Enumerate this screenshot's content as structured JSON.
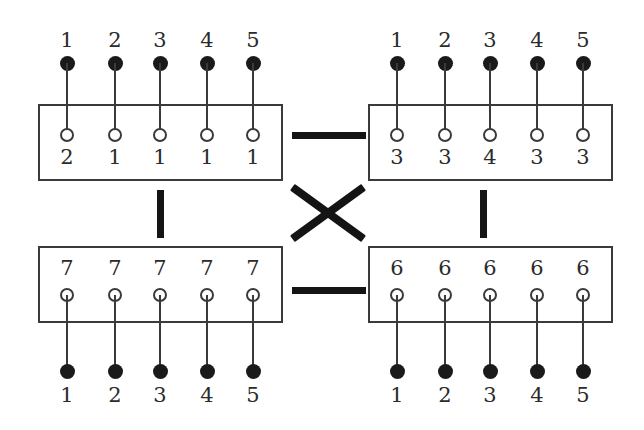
{
  "figure": {
    "colors": {
      "ink": "#2b2b2b",
      "box_stroke": "#3a3a3a",
      "connector": "#141414",
      "node_fill": "#1a1a1a",
      "background": "#ffffff"
    }
  },
  "boxes": [
    {
      "id": "top-left",
      "outer_labels": [
        "1",
        "2",
        "3",
        "4",
        "5"
      ],
      "inner_labels": [
        "2",
        "1",
        "1",
        "1",
        "1"
      ],
      "outer_position": "above",
      "inner_position": "below-circle",
      "node_count": 5
    },
    {
      "id": "top-right",
      "outer_labels": [
        "1",
        "2",
        "3",
        "4",
        "5"
      ],
      "inner_labels": [
        "3",
        "3",
        "4",
        "3",
        "3"
      ],
      "outer_position": "above",
      "inner_position": "below-circle",
      "node_count": 5
    },
    {
      "id": "bottom-left",
      "outer_labels": [
        "1",
        "2",
        "3",
        "4",
        "5"
      ],
      "inner_labels": [
        "7",
        "7",
        "7",
        "7",
        "7"
      ],
      "outer_position": "below",
      "inner_position": "above-circle",
      "node_count": 5
    },
    {
      "id": "bottom-right",
      "outer_labels": [
        "1",
        "2",
        "3",
        "4",
        "5"
      ],
      "inner_labels": [
        "6",
        "6",
        "6",
        "6",
        "6"
      ],
      "outer_position": "below",
      "inner_position": "above-circle",
      "node_count": 5
    }
  ],
  "connectors": [
    {
      "id": "top-horizontal-bar",
      "kind": "horizontal-bar",
      "between": [
        "top-left",
        "top-right"
      ]
    },
    {
      "id": "bottom-horizontal-bar",
      "kind": "horizontal-bar",
      "between": [
        "bottom-left",
        "bottom-right"
      ]
    },
    {
      "id": "left-vertical-bar",
      "kind": "vertical-bar",
      "between": [
        "top-left",
        "bottom-left"
      ]
    },
    {
      "id": "right-vertical-bar",
      "kind": "vertical-bar",
      "between": [
        "top-right",
        "bottom-right"
      ]
    },
    {
      "id": "center-cross",
      "kind": "x-cross",
      "between": [
        "top-left",
        "bottom-right",
        "top-right",
        "bottom-left"
      ]
    }
  ]
}
